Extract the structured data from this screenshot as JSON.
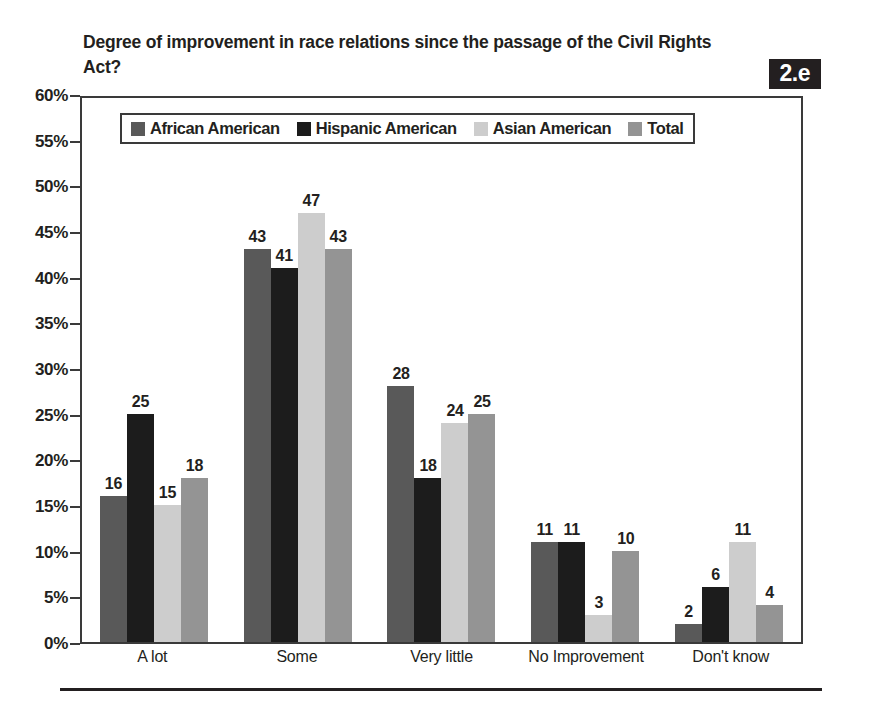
{
  "title": "Degree of improvement in race relations since the passage of the Civil Rights Act?",
  "badge": "2.e",
  "colors": {
    "african_american": "#595959",
    "hispanic_american": "#1c1c1c",
    "asian_american": "#cdcdcd",
    "total": "#949494",
    "axis": "#3a3a3a",
    "text": "#231f20",
    "badge_bg": "#231f20",
    "badge_text": "#ffffff"
  },
  "legend": {
    "items": [
      {
        "label": "African American",
        "color": "#595959"
      },
      {
        "label": "Hispanic American",
        "color": "#1c1c1c"
      },
      {
        "label": "Asian American",
        "color": "#cdcdcd"
      },
      {
        "label": "Total",
        "color": "#949494"
      }
    ]
  },
  "y_axis": {
    "ticks": [
      "0%",
      "5%",
      "10%",
      "15%",
      "20%",
      "25%",
      "30%",
      "35%",
      "40%",
      "45%",
      "50%",
      "55%",
      "60%"
    ]
  },
  "chart_data": {
    "type": "bar",
    "title": "Degree of improvement in race relations since the passage of the Civil Rights Act?",
    "xlabel": "",
    "ylabel": "",
    "ylim": [
      0,
      60
    ],
    "ytick_step": 5,
    "grid": false,
    "legend_position": "top-inside",
    "value_labels": true,
    "categories": [
      "A lot",
      "Some",
      "Very little",
      "No Improvement",
      "Don't know"
    ],
    "series": [
      {
        "name": "African American",
        "color": "#595959",
        "values": [
          16,
          43,
          28,
          11,
          2
        ]
      },
      {
        "name": "Hispanic American",
        "color": "#1c1c1c",
        "values": [
          25,
          41,
          18,
          11,
          6
        ]
      },
      {
        "name": "Asian American",
        "color": "#cdcdcd",
        "values": [
          15,
          47,
          24,
          3,
          11
        ]
      },
      {
        "name": "Total",
        "color": "#949494",
        "values": [
          18,
          43,
          25,
          10,
          4
        ]
      }
    ]
  }
}
